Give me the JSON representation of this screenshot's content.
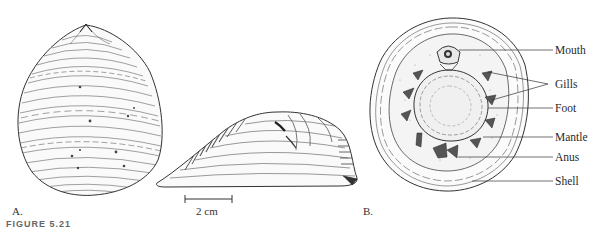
{
  "figure": {
    "panels": [
      {
        "id": "A",
        "label": "A.",
        "description": "dorsal view of shell"
      },
      {
        "id": "A-side",
        "label": "",
        "description": "lateral view of shell"
      },
      {
        "id": "B",
        "label": "B.",
        "description": "ventral view showing anatomy"
      }
    ],
    "scale_bar": {
      "label": "2 cm"
    },
    "annotations": [
      {
        "text": "Mouth"
      },
      {
        "text": "Gills"
      },
      {
        "text": "Foot"
      },
      {
        "text": "Mantle"
      },
      {
        "text": "Anus"
      },
      {
        "text": "Shell"
      }
    ],
    "caption": "FIGURE 5.21",
    "colors": {
      "ink": "#2a2a2a",
      "background": "#ffffff"
    }
  }
}
